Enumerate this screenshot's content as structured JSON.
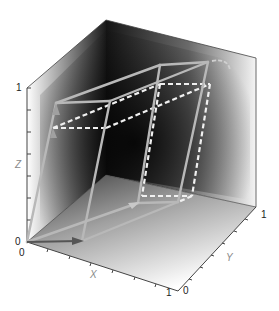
{
  "figure": {
    "type": "3d-box-diagram",
    "axes": {
      "x": {
        "label": "X",
        "ticks": [
          "0",
          "1"
        ],
        "tick_count": 10
      },
      "y": {
        "label": "Y",
        "ticks": [
          "0",
          "1"
        ],
        "tick_count": 10
      },
      "z": {
        "label": "Z",
        "ticks": [
          "0",
          "1"
        ],
        "tick_count": 10
      }
    },
    "colors": {
      "solid_edges": "#b8b8b8",
      "dashed_edges": "#f2f2f2",
      "arrow_dark": "#555555",
      "wall_dark": "#0a0a0a",
      "wall_light": "#ffffff",
      "axis_line": "#444444"
    },
    "labels": {
      "z_top": "1",
      "z_origin": "0",
      "x_origin": "0",
      "x_end": "1",
      "y_origin": "0",
      "y_end": "1",
      "x_axis": "X",
      "y_axis": "Y",
      "z_axis": "Z"
    }
  }
}
